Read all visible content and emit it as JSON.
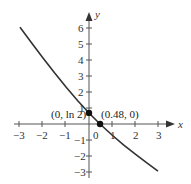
{
  "chart_data": {
    "type": "line",
    "title": "",
    "xlabel": "x",
    "ylabel": "y",
    "xlim": [
      -3,
      3
    ],
    "ylim": [
      -3,
      6
    ],
    "grid": false,
    "x_ticks": [
      "-3",
      "-2",
      "-1",
      "0",
      "1",
      "2",
      "3"
    ],
    "y_ticks": [
      "6",
      "5",
      "4",
      "3",
      "2",
      "1",
      "-1",
      "-2",
      "-3"
    ],
    "series": [
      {
        "name": "curve",
        "x": [
          -3,
          -2.5,
          -2,
          -1.5,
          -1,
          -0.5,
          0,
          0.48,
          1,
          1.5,
          2,
          2.5,
          3
        ],
        "y": [
          6.05,
          5.08,
          4.13,
          3.2,
          2.31,
          1.47,
          0.69,
          0.0,
          -0.69,
          -1.3,
          -1.87,
          -2.42,
          -2.95
        ]
      }
    ],
    "points": [
      {
        "x": 0,
        "y": 0.693,
        "label": "(0, ln 2)"
      },
      {
        "x": 0.48,
        "y": 0,
        "label": "(0.48, 0)"
      }
    ],
    "colors": {
      "curve": "#333333",
      "axes": "#555555",
      "points": "#111111"
    }
  }
}
